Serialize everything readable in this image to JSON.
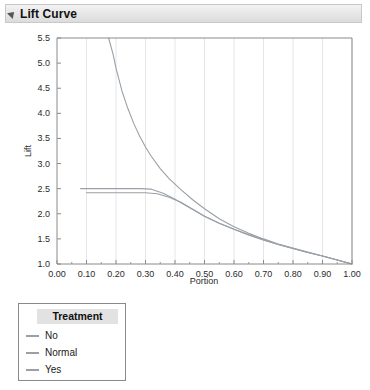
{
  "panel": {
    "title": "Lift Curve",
    "disclosure_icon": "triangle-collapse-icon"
  },
  "legend": {
    "title": "Treatment",
    "entries": [
      {
        "label": "No",
        "color": "#9aa0a6"
      },
      {
        "label": "Normal",
        "color": "#9aa0a6"
      },
      {
        "label": "Yes",
        "color": "#9aa0a6"
      }
    ]
  },
  "chart_data": {
    "type": "line",
    "title": "Lift Curve",
    "xlabel": "Portion",
    "ylabel": "Lift",
    "xlim": [
      0.0,
      1.0
    ],
    "ylim": [
      1.0,
      5.5
    ],
    "xticks": [
      "0.00",
      "0.10",
      "0.20",
      "0.30",
      "0.40",
      "0.50",
      "0.60",
      "0.70",
      "0.80",
      "0.90",
      "1.00"
    ],
    "xtick_values": [
      0.0,
      0.1,
      0.2,
      0.3,
      0.4,
      0.5,
      0.6,
      0.7,
      0.8,
      0.9,
      1.0
    ],
    "yticks": [
      "1.0",
      "1.5",
      "2.0",
      "2.5",
      "3.0",
      "3.5",
      "4.0",
      "4.5",
      "5.0",
      "5.5"
    ],
    "ytick_values": [
      1.0,
      1.5,
      2.0,
      2.5,
      3.0,
      3.5,
      4.0,
      4.5,
      5.0,
      5.5
    ],
    "grid": "vertical",
    "legend_position": "below-left",
    "series": [
      {
        "name": "No",
        "color": "#9aa0a6",
        "x": [
          0.08,
          0.12,
          0.16,
          0.2,
          0.24,
          0.28,
          0.32,
          0.36,
          0.4,
          0.45,
          0.5,
          0.55,
          0.6,
          0.65,
          0.7,
          0.75,
          0.8,
          0.85,
          0.9,
          0.95,
          1.0
        ],
        "y": [
          2.5,
          2.5,
          2.5,
          2.5,
          2.5,
          2.5,
          2.49,
          2.41,
          2.29,
          2.12,
          1.95,
          1.81,
          1.69,
          1.58,
          1.48,
          1.39,
          1.31,
          1.23,
          1.16,
          1.08,
          1.0
        ]
      },
      {
        "name": "Normal",
        "color": "#9aa0a6",
        "x": [
          0.1,
          0.14,
          0.18,
          0.22,
          0.26,
          0.3,
          0.34,
          0.38,
          0.42,
          0.46,
          0.5,
          0.55,
          0.6,
          0.65,
          0.7,
          0.75,
          0.8,
          0.85,
          0.9,
          0.95,
          1.0
        ],
        "y": [
          2.42,
          2.42,
          2.42,
          2.42,
          2.42,
          2.42,
          2.4,
          2.33,
          2.23,
          2.09,
          1.95,
          1.81,
          1.69,
          1.58,
          1.48,
          1.39,
          1.31,
          1.23,
          1.16,
          1.08,
          1.0
        ]
      },
      {
        "name": "Yes",
        "color": "#9aa0a6",
        "x": [
          0.175,
          0.19,
          0.2,
          0.22,
          0.24,
          0.26,
          0.28,
          0.3,
          0.32,
          0.35,
          0.38,
          0.42,
          0.46,
          0.5,
          0.55,
          0.6,
          0.65,
          0.7,
          0.75,
          0.8,
          0.85,
          0.9,
          0.95,
          1.0
        ],
        "y": [
          5.5,
          5.18,
          4.9,
          4.45,
          4.1,
          3.8,
          3.55,
          3.33,
          3.14,
          2.9,
          2.7,
          2.48,
          2.28,
          2.1,
          1.9,
          1.74,
          1.61,
          1.5,
          1.4,
          1.32,
          1.24,
          1.16,
          1.08,
          1.0
        ]
      }
    ]
  }
}
